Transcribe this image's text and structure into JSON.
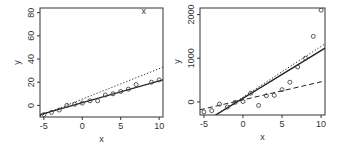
{
  "chart_data": [
    {
      "type": "scatter",
      "title": "",
      "xlabel": "x",
      "ylabel": "y",
      "xlim": [
        -5.5,
        10.5
      ],
      "ylim": [
        -10,
        84
      ],
      "xticks": [
        "-5",
        "0",
        "5",
        "10"
      ],
      "yticks": [
        "0",
        "20",
        "40",
        "60",
        "80"
      ],
      "grid": false,
      "points": [
        [
          -5,
          -8
        ],
        [
          -4,
          -6
        ],
        [
          -3,
          -4
        ],
        [
          -2,
          0
        ],
        [
          -1,
          1
        ],
        [
          0,
          2
        ],
        [
          1,
          4
        ],
        [
          2,
          4
        ],
        [
          3,
          9
        ],
        [
          4,
          10
        ],
        [
          5,
          12
        ],
        [
          6,
          14
        ],
        [
          7,
          18
        ],
        [
          9,
          20
        ],
        [
          10,
          22
        ]
      ],
      "outlier": {
        "x": 8,
        "y": 81,
        "marker": "x"
      },
      "lines": [
        {
          "name": "solid fit",
          "style": "solid",
          "from": [
            -5.5,
            -8
          ],
          "to": [
            10.5,
            22
          ]
        },
        {
          "name": "dotted fit",
          "style": "dotted",
          "from": [
            -5.5,
            -9
          ],
          "to": [
            10.5,
            33
          ]
        }
      ]
    },
    {
      "type": "scatter",
      "title": "",
      "xlabel": "x",
      "ylabel": "y",
      "xlim": [
        -5.5,
        10.5
      ],
      "ylim": [
        -300,
        2150
      ],
      "xticks": [
        "-5",
        "0",
        "5",
        "10"
      ],
      "yticks": [
        "0",
        "1000",
        "2000"
      ],
      "grid": false,
      "points": [
        [
          -5,
          -230
        ],
        [
          -4,
          -200
        ],
        [
          -3,
          -50
        ],
        [
          -2,
          -120
        ],
        [
          -1,
          -10
        ],
        [
          0,
          10
        ],
        [
          1,
          200
        ],
        [
          2,
          -80
        ],
        [
          3,
          140
        ],
        [
          4,
          150
        ],
        [
          5,
          280
        ],
        [
          6,
          450
        ],
        [
          7,
          800
        ],
        [
          8,
          1000
        ],
        [
          9,
          1500
        ],
        [
          10,
          2100
        ]
      ],
      "lines": [
        {
          "name": "solid fit",
          "style": "solid",
          "from": [
            -3.5,
            -300
          ],
          "to": [
            10.5,
            1230
          ]
        },
        {
          "name": "dotted fit",
          "style": "dotted",
          "from": [
            -3.5,
            -300
          ],
          "to": [
            10.5,
            1330
          ]
        },
        {
          "name": "dashed fit",
          "style": "dashed",
          "from": [
            -5.5,
            -180
          ],
          "to": [
            10.5,
            480
          ]
        }
      ]
    }
  ]
}
